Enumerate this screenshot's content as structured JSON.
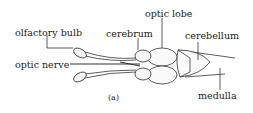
{
  "diagram": {
    "caption": "(a)",
    "labels": {
      "olfactory_bulb": "olfactory bulb",
      "cerebrum": "cerebrum",
      "optic_lobe": "optic lobe",
      "cerebellum": "cerebellum",
      "optic_nerve": "optic nerve",
      "medulla": "medulla"
    }
  }
}
